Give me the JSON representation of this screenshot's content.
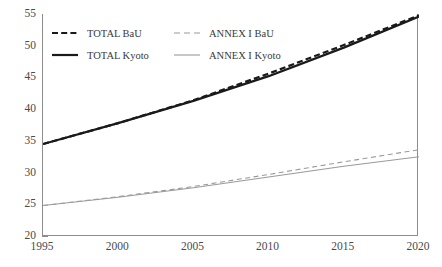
{
  "chart_data": {
    "type": "line",
    "title": "",
    "subtitle": "",
    "xlabel": "",
    "ylabel": "",
    "xlim": [
      1995,
      2020
    ],
    "ylim": [
      20,
      55
    ],
    "grid": false,
    "legend_position": "upper-left-inside",
    "x": [
      1995,
      2000,
      2005,
      2010,
      2015,
      2020
    ],
    "xticklabels": [
      "1995",
      "2000",
      "2005",
      "2010",
      "2015",
      "2020"
    ],
    "yticks": [
      20,
      25,
      30,
      35,
      40,
      45,
      50,
      55
    ],
    "yticklabels": [
      "20",
      "25",
      "30",
      "35",
      "40",
      "45",
      "50",
      "55"
    ],
    "series": [
      {
        "name": "TOTAL BaU",
        "style": "dashed",
        "color": "#1a1a1a",
        "width": 2.2,
        "values": [
          34.5,
          37.8,
          41.4,
          45.6,
          50.1,
          54.8
        ]
      },
      {
        "name": "TOTAL Kyoto",
        "style": "solid",
        "color": "#1a1a1a",
        "width": 2.2,
        "values": [
          34.5,
          37.8,
          41.3,
          45.2,
          49.7,
          54.6
        ]
      },
      {
        "name": "ANNEX I BaU",
        "style": "dashed",
        "color": "#9a9a9a",
        "width": 1.1,
        "values": [
          24.8,
          26.2,
          27.8,
          29.7,
          31.7,
          33.6
        ]
      },
      {
        "name": "ANNEX I Kyoto",
        "style": "solid",
        "color": "#9a9a9a",
        "width": 1.1,
        "values": [
          24.8,
          26.1,
          27.6,
          29.3,
          31.0,
          32.5
        ]
      }
    ]
  },
  "legend": {
    "rows": [
      {
        "left": "TOTAL BaU",
        "right": "ANNEX I BaU"
      },
      {
        "left": "TOTAL Kyoto",
        "right": "ANNEX I Kyoto"
      }
    ]
  },
  "colors": {
    "total": "#1a1a1a",
    "annex": "#9a9a9a",
    "axis": "#8d8d8d",
    "tick_text": "#4a4a4a",
    "background": "#ffffff"
  }
}
